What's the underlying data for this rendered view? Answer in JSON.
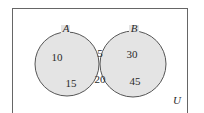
{
  "diagram": {
    "type": "venn",
    "universe_label": "U",
    "sets": [
      {
        "name": "A",
        "only": [
          "10",
          "15"
        ]
      },
      {
        "name": "B",
        "only": [
          "30",
          "45"
        ]
      }
    ],
    "intersection": [
      "5",
      "20"
    ],
    "colors": {
      "fill": "#e4e4e4",
      "stroke": "#555555",
      "border": "#666666"
    }
  }
}
